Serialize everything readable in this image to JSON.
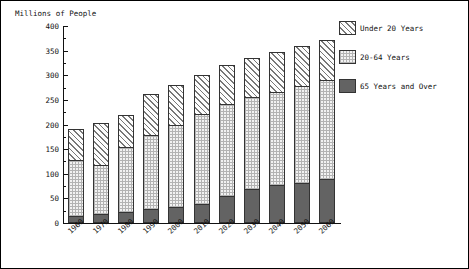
{
  "chart_data": {
    "type": "bar",
    "subtype": "stacked-bar",
    "title": "",
    "ylabel": "Millions of People",
    "xlabel": "",
    "ylim": [
      0,
      400
    ],
    "yticks": [
      0,
      50,
      100,
      150,
      200,
      250,
      300,
      350,
      400
    ],
    "yticks_minor": [
      25,
      75,
      125,
      175,
      225,
      275,
      325,
      375
    ],
    "grid": false,
    "legend_position": "right",
    "categories": [
      "1960",
      "1970",
      "1980",
      "1990",
      "2000",
      "2010",
      "2020",
      "2030",
      "2040",
      "2050",
      "2060"
    ],
    "series": [
      {
        "name": "65 Years and Over",
        "values": [
          16,
          20,
          25,
          31,
          35,
          40,
          56,
          72,
          80,
          84,
          92
        ]
      },
      {
        "name": "20-64 Years",
        "values": [
          114,
          100,
          131,
          150,
          166,
          184,
          188,
          186,
          189,
          196,
          200
        ]
      },
      {
        "name": "Under 20 Years",
        "values": [
          60,
          83,
          64,
          80,
          80,
          77,
          77,
          77,
          78,
          79,
          80
        ]
      }
    ],
    "totals": [
      190,
      203,
      220,
      261,
      281,
      301,
      321,
      335,
      347,
      359,
      372
    ],
    "stack_order": [
      "65 Years and Over",
      "20-64 Years",
      "Under 20 Years"
    ],
    "colors": {
      "under20": "#fdfdfd",
      "age2064": "#f2f2f2",
      "over65": "#636363",
      "axis": "#111111",
      "border": "#333333"
    }
  },
  "legend": {
    "items": [
      {
        "label": "Under 20 Years",
        "swatch": "under20-hatch-swatch"
      },
      {
        "label": "20-64 Years",
        "swatch": "age2064-dotted-swatch"
      },
      {
        "label": "65 Years and Over",
        "swatch": "over65-solid-swatch"
      }
    ]
  }
}
